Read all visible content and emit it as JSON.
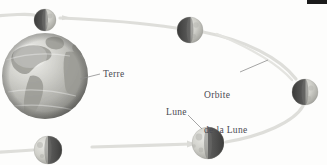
{
  "figure": {
    "language": "fr",
    "background_color": "#fdfdfc",
    "line_color": "#d9d9d6",
    "text_color": "#4a4a52",
    "leader_color": "#9a9a9a"
  },
  "labels": {
    "earth": "Terre",
    "orbit_line1": "Orbite",
    "orbit_line2": "de la Lune",
    "moon": "Lune"
  },
  "bodies": {
    "earth": {
      "name": "Terre",
      "cx": 45,
      "cy": 76,
      "r": 43,
      "highlight_color": "#efefec",
      "mid_color": "#b9b9b4",
      "shadow_color": "#7c7c78"
    },
    "moons": [
      {
        "name": "moon-top-left",
        "cx": 45,
        "cy": 20,
        "r": 11,
        "lit_side": "right"
      },
      {
        "name": "moon-top-right",
        "cx": 190,
        "cy": 30,
        "r": 13,
        "lit_side": "right"
      },
      {
        "name": "moon-right",
        "cx": 305,
        "cy": 92,
        "r": 13,
        "lit_side": "right"
      },
      {
        "name": "moon-bottom-right",
        "cx": 208,
        "cy": 143,
        "r": 16,
        "lit_side": "left"
      },
      {
        "name": "moon-bottom-left",
        "cx": 48,
        "cy": 150,
        "r": 14,
        "lit_side": "left"
      }
    ]
  },
  "orbit": {
    "description": "elliptical orbit band of the Moon around the Earth",
    "stroke_width": 3.2,
    "color": "#dedeDA"
  },
  "corner_mark": {
    "name": "page-edge-mark",
    "color": "#1b1b1b",
    "width": 20,
    "height": 4
  }
}
